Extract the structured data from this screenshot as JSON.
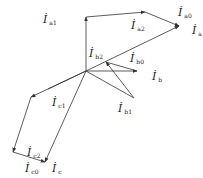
{
  "diagram": {
    "type": "phasor-vector-diagram",
    "stroke_color": "#333333",
    "labels": [
      {
        "id": "ia1",
        "main": "İ",
        "sub": "a1",
        "x": 43,
        "y": 14
      },
      {
        "id": "ia2",
        "main": "İ",
        "sub": "a2",
        "x": 131,
        "y": 20
      },
      {
        "id": "ia0",
        "main": "İ",
        "sub": "a0",
        "x": 178,
        "y": 7
      },
      {
        "id": "ia",
        "main": "İ",
        "sub": "a",
        "x": 192,
        "y": 25
      },
      {
        "id": "ib2",
        "main": "İ",
        "sub": "b2",
        "x": 89,
        "y": 48
      },
      {
        "id": "ib0",
        "main": "İ",
        "sub": "b0",
        "x": 130,
        "y": 53
      },
      {
        "id": "ib",
        "main": "İ",
        "sub": "b",
        "x": 152,
        "y": 71
      },
      {
        "id": "ib1",
        "main": "İ",
        "sub": "b1",
        "x": 118,
        "y": 103
      },
      {
        "id": "ic1",
        "main": "İ",
        "sub": "c1",
        "x": 52,
        "y": 97
      },
      {
        "id": "ic2",
        "main": "İ",
        "sub": "c2",
        "x": 27,
        "y": 147
      },
      {
        "id": "ic0",
        "main": "İ",
        "sub": "c0",
        "x": 25,
        "y": 163
      },
      {
        "id": "ic",
        "main": "İ",
        "sub": "c",
        "x": 52,
        "y": 163
      }
    ]
  }
}
